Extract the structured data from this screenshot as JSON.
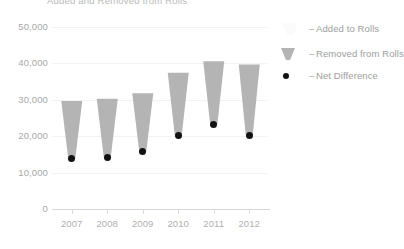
{
  "chart_data": {
    "type": "bar",
    "title": "Added and Removed from Rolls",
    "subtitle": "",
    "xlabel": "",
    "ylabel": "",
    "categories": [
      "2007",
      "2008",
      "2009",
      "2010",
      "2011",
      "2012"
    ],
    "ylim": [
      0,
      50000
    ],
    "yticks": [
      0,
      10000,
      20000,
      30000,
      40000,
      50000
    ],
    "ytick_labels": [
      "0",
      "10,000",
      "20,000",
      "30,000",
      "40,000",
      "50,000"
    ],
    "grid": true,
    "legend_position": "right",
    "series": [
      {
        "name": "Added to Rolls",
        "values": [
          29700,
          30300,
          31800,
          37400,
          40600,
          39700
        ]
      },
      {
        "name": "Removed from Rolls",
        "values": [
          15900,
          16100,
          16100,
          17100,
          17500,
          19400
        ]
      },
      {
        "name": "Net Difference",
        "values": [
          13800,
          14200,
          15700,
          20300,
          23100,
          20300
        ]
      }
    ],
    "annotations": []
  },
  "legend": {
    "items": [
      {
        "label": "Added to Rolls",
        "dash": "–",
        "marker": "funnel-top-swatch",
        "color": "#f7f7f7"
      },
      {
        "label": "Removed from Rolls",
        "dash": "–",
        "marker": "funnel-swatch",
        "color": "#b4b4b4"
      },
      {
        "label": "Net Difference",
        "dash": "–",
        "marker": "dot-swatch",
        "color": "#121212"
      }
    ]
  },
  "colors": {
    "background": "#ffffff",
    "funnel": "#b4b4b4",
    "dot": "#121212",
    "gridline": "#f2f2f2",
    "axis": "#d8d8d8",
    "tick_text": "#a8a8a8",
    "title_text": "#b9b9b9",
    "legend_text": "#9d9d9d"
  }
}
